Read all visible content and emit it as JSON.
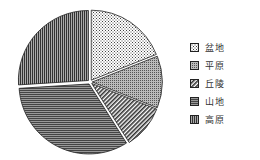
{
  "chart_data": {
    "type": "pie",
    "title": "",
    "slices": [
      {
        "label": "盆地",
        "value": 19,
        "pattern": "dots"
      },
      {
        "label": "平原",
        "value": 12,
        "pattern": "dense-grid"
      },
      {
        "label": "丘陵",
        "value": 10,
        "pattern": "diagonal"
      },
      {
        "label": "山地",
        "value": 33,
        "pattern": "horizontal"
      },
      {
        "label": "高原",
        "value": 26,
        "pattern": "vertical"
      }
    ],
    "legend_position": "right",
    "start_angle": "top",
    "direction": "clockwise"
  },
  "legend": {
    "items": [
      {
        "label": "盆地"
      },
      {
        "label": "平原"
      },
      {
        "label": "丘陵"
      },
      {
        "label": "山地"
      },
      {
        "label": "高原"
      }
    ]
  }
}
